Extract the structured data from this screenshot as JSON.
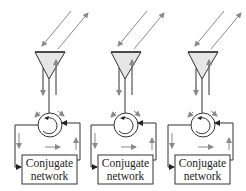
{
  "diagram": {
    "type": "retrodirective-array",
    "colors": {
      "line": "#333333",
      "arrow": "#8a8a8a",
      "antenna_fill": "#e6e6e6",
      "background": "#ffffff"
    },
    "units": [
      {
        "id": 1,
        "antenna": "antenna-1",
        "circulator": "circulator-1",
        "network": {
          "line1": "Conjugate",
          "line2": "network"
        }
      },
      {
        "id": 2,
        "antenna": "antenna-2",
        "circulator": "circulator-2",
        "network": {
          "line1": "Conjugate",
          "line2": "network"
        }
      },
      {
        "id": 3,
        "antenna": "antenna-3",
        "circulator": "circulator-3",
        "network": {
          "line1": "Conjugate",
          "line2": "network"
        }
      }
    ]
  }
}
